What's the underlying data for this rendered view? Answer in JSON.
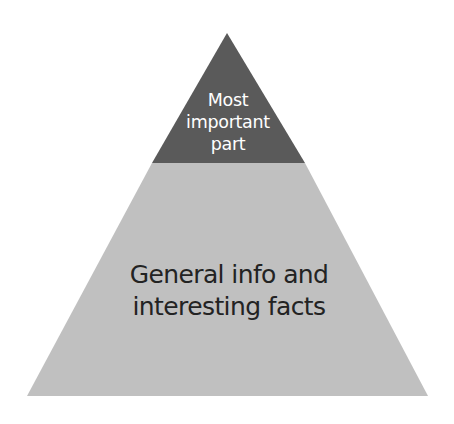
{
  "diagram": {
    "type": "pyramid",
    "tiers": [
      {
        "name": "top",
        "lines": [
          "Most",
          "important",
          "part"
        ],
        "fill": "#5a5a5a",
        "text_color": "#ffffff"
      },
      {
        "name": "base",
        "lines": [
          "General info and",
          "interesting facts"
        ],
        "fill": "#c0c0c0",
        "text_color": "#232323"
      }
    ]
  }
}
